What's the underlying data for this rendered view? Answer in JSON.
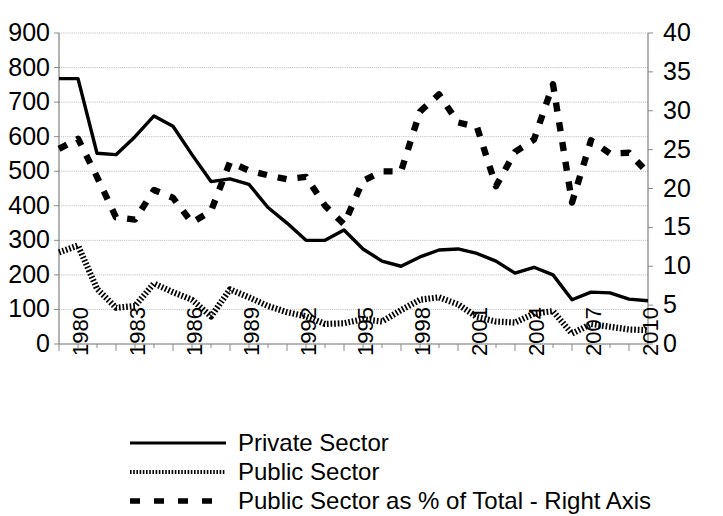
{
  "chart_data": {
    "type": "line",
    "title": "",
    "xlabel": "",
    "ylabel": "",
    "y2label": "",
    "grid": true,
    "legend_position": "bottom",
    "x": [
      1980,
      1981,
      1982,
      1983,
      1984,
      1985,
      1986,
      1987,
      1988,
      1989,
      1990,
      1991,
      1992,
      1993,
      1994,
      1995,
      1996,
      1997,
      1998,
      1999,
      2000,
      2001,
      2002,
      2003,
      2004,
      2005,
      2006,
      2007,
      2008,
      2009,
      2010,
      2011
    ],
    "xtick_labels": [
      "1980",
      "1983",
      "1986",
      "1989",
      "1992",
      "1995",
      "1998",
      "2001",
      "2004",
      "2007",
      "2010"
    ],
    "xtick_values": [
      1980,
      1983,
      1986,
      1989,
      1992,
      1995,
      1998,
      2001,
      2004,
      2007,
      2010
    ],
    "xlim": [
      1980,
      2011
    ],
    "ylim": [
      0,
      900
    ],
    "ytick_labels": [
      "0",
      "100",
      "200",
      "300",
      "400",
      "500",
      "600",
      "700",
      "800",
      "900"
    ],
    "ytick_values": [
      0,
      100,
      200,
      300,
      400,
      500,
      600,
      700,
      800,
      900
    ],
    "y2lim": [
      0,
      40
    ],
    "y2tick_labels": [
      "0",
      "5",
      "10",
      "15",
      "20",
      "25",
      "30",
      "35",
      "40"
    ],
    "y2tick_values": [
      0,
      5,
      10,
      15,
      20,
      25,
      30,
      35,
      40
    ],
    "series": [
      {
        "name": "Private Sector",
        "axis": "left",
        "style": "solid",
        "color": "#000000",
        "values": [
          768,
          768,
          552,
          548,
          600,
          660,
          630,
          548,
          470,
          478,
          462,
          395,
          350,
          300,
          300,
          330,
          275,
          240,
          225,
          252,
          272,
          275,
          262,
          240,
          205,
          222,
          200,
          128,
          150,
          148,
          130,
          125
        ]
      },
      {
        "name": "Public Sector",
        "axis": "left",
        "style": "beaded",
        "color": "#000000",
        "values": [
          265,
          285,
          160,
          105,
          110,
          175,
          150,
          128,
          80,
          158,
          135,
          110,
          92,
          80,
          58,
          60,
          72,
          65,
          98,
          128,
          135,
          115,
          78,
          65,
          62,
          88,
          95,
          30,
          58,
          50,
          42,
          40
        ]
      },
      {
        "name": "Public Sector as % of Total - Right Axis",
        "axis": "right",
        "style": "dashed",
        "color": "#000000",
        "values": [
          25.1,
          26.4,
          21.5,
          16.3,
          16.0,
          19.8,
          18.8,
          15.6,
          17.1,
          23.4,
          22.3,
          21.7,
          21.2,
          21.5,
          17.8,
          15.4,
          21.0,
          22.2,
          22.2,
          29.9,
          32.1,
          28.5,
          27.9,
          20.3,
          24.7,
          26.3,
          33.4,
          18.2,
          26.2,
          24.5,
          24.6,
          22.0
        ]
      }
    ]
  },
  "axes": {
    "left_ticks": [
      "900",
      "800",
      "700",
      "600",
      "500",
      "400",
      "300",
      "200",
      "100",
      "0"
    ],
    "right_ticks": [
      "40",
      "35",
      "30",
      "25",
      "20",
      "15",
      "10",
      "5",
      "0"
    ],
    "x_ticks": [
      "1980",
      "1983",
      "1986",
      "1989",
      "1992",
      "1995",
      "1998",
      "2001",
      "2004",
      "2007",
      "2010"
    ]
  },
  "legend": {
    "items": [
      {
        "label": "Private Sector",
        "key": "solid-line-key"
      },
      {
        "label": "Public Sector",
        "key": "beaded-line-key"
      },
      {
        "label": "Public Sector as % of Total - Right Axis",
        "key": "dashed-line-key"
      }
    ]
  }
}
